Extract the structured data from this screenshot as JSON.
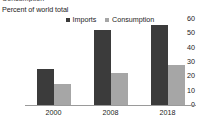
{
  "clipped_header_text": "Consumption",
  "chart_data": {
    "type": "bar",
    "title": "",
    "ylabel": "Percent of world total",
    "xlabel": "",
    "categories": [
      "2000",
      "2008",
      "2018"
    ],
    "series": [
      {
        "name": "Imports",
        "color": "#3b3b3b",
        "values": [
          25,
          52,
          56
        ]
      },
      {
        "name": "Consumption",
        "color": "#a6a6a6",
        "values": [
          15,
          22,
          28
        ]
      }
    ],
    "ylim": [
      0,
      60
    ],
    "yticks": [
      "0",
      "10",
      "20",
      "30",
      "40",
      "50",
      "60"
    ],
    "ytick_values": [
      0,
      10,
      20,
      30,
      40,
      50,
      60
    ],
    "grid": false,
    "legend_position": "top-center"
  }
}
